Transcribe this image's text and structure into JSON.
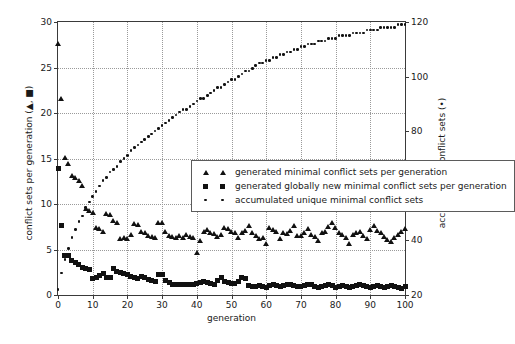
{
  "chart_data": {
    "type": "scatter",
    "title": "",
    "xlabel": "generation",
    "ylabel": "conflict sets per generation (▲, ■)",
    "ylabel_right": "accumulated conflict sets (•)",
    "xlim": [
      0,
      100
    ],
    "ylim": [
      0,
      30
    ],
    "ylim_right": [
      20,
      120
    ],
    "xticks": [
      0,
      10,
      20,
      30,
      40,
      50,
      60,
      70,
      80,
      90,
      100
    ],
    "xtick_labels": [
      "0",
      "10",
      "20",
      "30",
      "40",
      "50",
      "60",
      "70",
      "80",
      "90",
      "100"
    ],
    "yticks": [
      0,
      5,
      10,
      15,
      20,
      25,
      30
    ],
    "ytick_labels": [
      "0",
      "5",
      "10",
      "15",
      "20",
      "25",
      "30"
    ],
    "yticks_right": [
      20,
      40,
      60,
      80,
      100,
      120
    ],
    "ytick_labels_right": [
      "20",
      "40",
      "60",
      "80",
      "100",
      "120"
    ],
    "grid": true,
    "legend_position": "center-left",
    "legend": [
      "generated minimal conflict sets per generation",
      "generated globally new minimal conflict sets per generation",
      "accumulated unique minimal conflict sets"
    ],
    "series": [
      {
        "name": "generated minimal conflict sets per generation",
        "marker": "triangle",
        "axis": "left",
        "x": [
          0,
          1,
          2,
          3,
          4,
          5,
          6,
          7,
          8,
          9,
          10,
          11,
          12,
          13,
          14,
          15,
          16,
          17,
          18,
          19,
          20,
          21,
          22,
          23,
          24,
          25,
          26,
          27,
          28,
          29,
          30,
          31,
          32,
          33,
          34,
          35,
          36,
          37,
          38,
          39,
          40,
          41,
          42,
          43,
          44,
          45,
          46,
          47,
          48,
          49,
          50,
          51,
          52,
          53,
          54,
          55,
          56,
          57,
          58,
          59,
          60,
          61,
          62,
          63,
          64,
          65,
          66,
          67,
          68,
          69,
          70,
          71,
          72,
          73,
          74,
          75,
          76,
          77,
          78,
          79,
          80,
          81,
          82,
          83,
          84,
          85,
          86,
          87,
          88,
          89,
          90,
          91,
          92,
          93,
          94,
          95,
          96,
          97,
          98,
          99,
          100
        ],
        "y": [
          27.6,
          21.6,
          15.1,
          14.4,
          13.1,
          12.9,
          12.6,
          12.0,
          9.5,
          9.3,
          9.1,
          7.4,
          7.3,
          7.0,
          8.9,
          8.8,
          8.2,
          8.0,
          6.2,
          6.3,
          6.2,
          6.6,
          7.8,
          7.7,
          7.0,
          6.8,
          6.5,
          6.4,
          6.3,
          7.9,
          8.0,
          7.0,
          6.5,
          6.4,
          6.3,
          6.5,
          6.3,
          6.6,
          6.4,
          6.3,
          4.7,
          6.0,
          7.0,
          7.2,
          6.9,
          6.7,
          6.4,
          6.6,
          7.4,
          7.3,
          7.0,
          6.8,
          6.3,
          6.9,
          7.1,
          7.6,
          6.9,
          6.5,
          6.2,
          6.3,
          5.6,
          7.4,
          7.2,
          7.0,
          6.2,
          6.9,
          6.7,
          7.1,
          7.6,
          6.5,
          6.5,
          6.9,
          7.3,
          6.6,
          6.4,
          6.0,
          6.8,
          7.0,
          7.5,
          8.0,
          7.4,
          6.9,
          6.6,
          6.3,
          5.6,
          6.6,
          6.8,
          7.0,
          6.5,
          6.2,
          7.2,
          7.6,
          7.1,
          6.8,
          6.4,
          6.1,
          5.9,
          6.3,
          6.6,
          7.0,
          7.3
        ]
      },
      {
        "name": "generated globally new minimal conflict sets per generation",
        "marker": "square",
        "axis": "left",
        "x": [
          0,
          1,
          2,
          3,
          4,
          5,
          6,
          7,
          8,
          9,
          10,
          11,
          12,
          13,
          14,
          15,
          16,
          17,
          18,
          19,
          20,
          21,
          22,
          23,
          24,
          25,
          26,
          27,
          28,
          29,
          30,
          31,
          32,
          33,
          34,
          35,
          36,
          37,
          38,
          39,
          40,
          41,
          42,
          43,
          44,
          45,
          46,
          47,
          48,
          49,
          50,
          51,
          52,
          53,
          54,
          55,
          56,
          57,
          58,
          59,
          60,
          61,
          62,
          63,
          64,
          65,
          66,
          67,
          68,
          69,
          70,
          71,
          72,
          73,
          74,
          75,
          76,
          77,
          78,
          79,
          80,
          81,
          82,
          83,
          84,
          85,
          86,
          87,
          88,
          89,
          90,
          91,
          92,
          93,
          94,
          95,
          96,
          97,
          98,
          99,
          100
        ],
        "y": [
          13.9,
          7.6,
          4.3,
          4.3,
          3.8,
          3.6,
          3.3,
          3.0,
          2.9,
          2.8,
          1.8,
          1.9,
          2.1,
          2.4,
          1.9,
          1.9,
          2.9,
          2.6,
          2.5,
          2.4,
          2.3,
          2.0,
          1.9,
          1.8,
          2.0,
          1.9,
          1.7,
          1.6,
          1.5,
          2.2,
          2.3,
          1.6,
          1.4,
          1.2,
          1.2,
          1.1,
          1.1,
          1.2,
          1.1,
          1.2,
          1.3,
          1.4,
          1.5,
          1.4,
          1.3,
          1.2,
          1.6,
          1.9,
          1.5,
          1.4,
          1.3,
          1.3,
          1.5,
          1.9,
          1.8,
          1.0,
          0.9,
          0.9,
          1.0,
          0.9,
          0.8,
          1.0,
          1.1,
          1.0,
          0.9,
          1.0,
          1.2,
          1.1,
          1.0,
          0.9,
          0.9,
          1.0,
          1.2,
          1.1,
          0.9,
          0.8,
          0.9,
          1.0,
          1.1,
          1.0,
          0.8,
          0.9,
          1.0,
          0.9,
          0.8,
          0.9,
          1.0,
          1.1,
          1.0,
          0.9,
          0.8,
          0.9,
          1.0,
          0.9,
          0.8,
          0.9,
          1.0,
          0.9,
          0.8,
          0.7,
          0.9
        ]
      },
      {
        "name": "accumulated unique minimal conflict sets",
        "marker": "dot",
        "axis": "right",
        "x": [
          0,
          1,
          2,
          3,
          4,
          5,
          6,
          7,
          8,
          9,
          10,
          11,
          12,
          13,
          14,
          15,
          16,
          17,
          18,
          19,
          20,
          21,
          22,
          23,
          24,
          25,
          26,
          27,
          28,
          29,
          30,
          31,
          32,
          33,
          34,
          35,
          36,
          37,
          38,
          39,
          40,
          41,
          42,
          43,
          44,
          45,
          46,
          47,
          48,
          49,
          50,
          51,
          52,
          53,
          54,
          55,
          56,
          57,
          58,
          59,
          60,
          61,
          62,
          63,
          64,
          65,
          66,
          67,
          68,
          69,
          70,
          71,
          72,
          73,
          74,
          75,
          76,
          77,
          78,
          79,
          80,
          81,
          82,
          83,
          84,
          85,
          86,
          87,
          88,
          89,
          90,
          91,
          92,
          93,
          94,
          95,
          96,
          97,
          98,
          99,
          100
        ],
        "y": [
          22,
          28,
          33,
          37,
          41,
          44,
          47,
          49,
          52,
          54,
          56,
          58,
          60,
          62,
          63,
          65,
          66,
          67,
          69,
          70,
          71,
          73,
          74,
          75,
          76,
          77,
          78,
          79,
          80,
          81,
          82,
          83,
          84,
          85,
          86,
          87,
          88,
          88,
          89,
          90,
          91,
          92,
          92,
          93,
          94,
          95,
          96,
          96,
          97,
          98,
          99,
          99,
          100,
          101,
          102,
          102,
          103,
          104,
          105,
          105,
          106,
          106,
          107,
          107,
          108,
          108,
          109,
          109,
          110,
          110,
          111,
          111,
          112,
          112,
          112,
          113,
          113,
          113,
          114,
          114,
          114,
          115,
          115,
          115,
          115,
          116,
          116,
          116,
          116,
          117,
          117,
          117,
          117,
          118,
          118,
          118,
          118,
          118,
          119,
          119,
          119
        ]
      }
    ]
  }
}
